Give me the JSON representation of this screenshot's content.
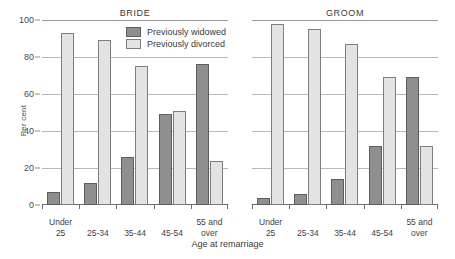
{
  "chart_data": {
    "type": "bar",
    "title": "",
    "xlabel": "Age at remarriage",
    "ylabel": "Per cent",
    "ylim": [
      0,
      100
    ],
    "yticks": [
      0,
      20,
      40,
      60,
      80,
      100
    ],
    "grid": true,
    "legend_position": "top-center-left-panel",
    "categories": [
      "Under 25",
      "25-34",
      "35-44",
      "45-54",
      "55 and over"
    ],
    "category_lines": [
      [
        "Under",
        "25"
      ],
      [
        "25-34",
        ""
      ],
      [
        "35-44",
        ""
      ],
      [
        "45-54",
        ""
      ],
      [
        "55 and",
        "over"
      ]
    ],
    "panels": [
      {
        "name": "BRIDE",
        "series": [
          {
            "name": "Previously widowed",
            "color": "#8f8f8f",
            "values": [
              7,
              12,
              26,
              49,
              76
            ]
          },
          {
            "name": "Previously divorced",
            "color": "#e3e3e1",
            "values": [
              93,
              89,
              75,
              51,
              24
            ]
          }
        ]
      },
      {
        "name": "GROOM",
        "series": [
          {
            "name": "Previously widowed",
            "color": "#8f8f8f",
            "values": [
              4,
              6,
              14,
              32,
              69
            ]
          },
          {
            "name": "Previously divorced",
            "color": "#e3e3e1",
            "values": [
              98,
              95,
              87,
              69,
              32
            ]
          }
        ]
      }
    ],
    "legend": [
      {
        "label": "Previously widowed",
        "color": "#8f8f8f"
      },
      {
        "label": "Previously divorced",
        "color": "#e3e3e1"
      }
    ]
  }
}
